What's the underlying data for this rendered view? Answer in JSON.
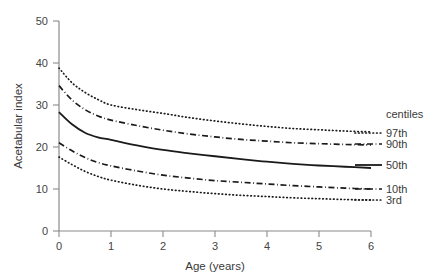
{
  "chart_data": {
    "type": "line",
    "title": "",
    "xlabel": "Age (years)",
    "ylabel": "Acetabular index",
    "xlim": [
      0,
      6
    ],
    "ylim": [
      0,
      50
    ],
    "grid": false,
    "legend_position": "right",
    "legend_title": "centiles",
    "xticks": [
      "0",
      "1",
      "2",
      "3",
      "4",
      "5",
      "6"
    ],
    "xtick_values": [
      0,
      1,
      2,
      3,
      4,
      5,
      6
    ],
    "yticks": [
      "0",
      "10",
      "20",
      "30",
      "40",
      "50"
    ],
    "ytick_values": [
      0,
      10,
      20,
      30,
      40,
      50
    ],
    "x": [
      0,
      0.25,
      0.5,
      0.75,
      1,
      1.5,
      2,
      2.5,
      3,
      3.5,
      4,
      4.5,
      5,
      5.5,
      6
    ],
    "series": [
      {
        "name": "97th",
        "style": "dotted",
        "color": "#1a1a1a",
        "values": [
          38.8,
          35.3,
          33.0,
          31.3,
          30.0,
          28.9,
          28.0,
          27.0,
          26.2,
          25.5,
          24.9,
          24.4,
          24.1,
          23.8,
          23.6
        ]
      },
      {
        "name": "90th",
        "style": "dash-dot",
        "color": "#1a1a1a",
        "values": [
          34.6,
          31.2,
          28.9,
          27.4,
          26.4,
          25.1,
          24.0,
          23.1,
          22.4,
          21.8,
          21.4,
          21.0,
          20.8,
          20.6,
          20.5
        ]
      },
      {
        "name": "50th",
        "style": "solid",
        "color": "#1a1a1a",
        "values": [
          28.3,
          25.4,
          23.4,
          22.3,
          21.7,
          20.4,
          19.3,
          18.5,
          17.8,
          17.1,
          16.5,
          16.0,
          15.6,
          15.3,
          15.0
        ]
      },
      {
        "name": "10th",
        "style": "dash-dot",
        "color": "#1a1a1a",
        "values": [
          21.0,
          19.1,
          17.5,
          16.3,
          15.5,
          14.3,
          13.3,
          12.6,
          12.0,
          11.6,
          11.2,
          10.8,
          10.5,
          10.2,
          10.0
        ]
      },
      {
        "name": "3rd",
        "style": "dotted",
        "color": "#1a1a1a",
        "values": [
          17.6,
          15.8,
          14.2,
          13.0,
          12.1,
          10.9,
          10.0,
          9.4,
          8.9,
          8.5,
          8.2,
          7.9,
          7.7,
          7.5,
          7.4
        ]
      }
    ]
  },
  "legend": {
    "title": "centiles",
    "entries": [
      {
        "label": "97th"
      },
      {
        "label": "90th"
      },
      {
        "label": "50th"
      },
      {
        "label": "10th"
      },
      {
        "label": "3rd"
      }
    ]
  },
  "axes": {
    "x_title": "Age (years)",
    "y_title": "Acetabular index",
    "x_ticks": [
      "0",
      "1",
      "2",
      "3",
      "4",
      "5",
      "6"
    ],
    "y_ticks": [
      "0",
      "10",
      "20",
      "30",
      "40",
      "50"
    ]
  },
  "colors": {
    "background": "#ffffff",
    "axis": "#8a8a8a",
    "curve": "#1a1a1a",
    "text": "#3a3a3a"
  }
}
